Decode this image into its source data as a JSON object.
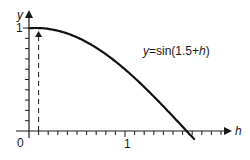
{
  "chart_data": {
    "type": "line",
    "title": "",
    "xlabel": "h",
    "ylabel": "y",
    "series": [
      {
        "name": "y=sin(1.5+h)",
        "function": "sin(1.5+h)",
        "x": [
          0,
          0.1,
          0.2,
          0.3,
          0.4,
          0.5,
          0.6,
          0.7,
          0.8,
          0.9,
          1.0,
          1.1,
          1.2,
          1.3,
          1.4,
          1.5,
          1.6,
          1.64,
          1.7
        ],
        "values": [
          0.997,
          1.0,
          0.991,
          0.974,
          0.946,
          0.909,
          0.863,
          0.808,
          0.746,
          0.675,
          0.598,
          0.516,
          0.427,
          0.335,
          0.239,
          0.141,
          0.042,
          0.002,
          -0.058
        ]
      }
    ],
    "annotations": [
      {
        "type": "dashed-arrow",
        "x": 0.1,
        "from_y": 0,
        "to_y": 1.0
      }
    ],
    "x_ticks": {
      "major": [
        0,
        1
      ],
      "minor_step": 0.1
    },
    "y_ticks": {
      "major": [
        1
      ],
      "minor_step": 0.1
    },
    "xlim": [
      0,
      1.95
    ],
    "ylim": [
      0,
      1.15
    ],
    "grid": false,
    "legend": "none"
  },
  "labels": {
    "origin": "0",
    "x_one": "1",
    "y_one": "1",
    "x_axis": "h",
    "y_axis": "y",
    "curve_prefix": "y",
    "curve_mid": "=sin(1.5+",
    "curve_var": "h",
    "curve_suffix": ")"
  },
  "colors": {
    "axis": "#1a1a1a",
    "curve": "#111111",
    "background": "#ffffff"
  }
}
